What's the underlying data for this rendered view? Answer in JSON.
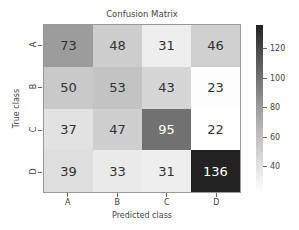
{
  "chart_data": {
    "type": "heatmap",
    "title": "Confusion Matrix",
    "xlabel": "Predicted class",
    "ylabel": "True class",
    "x_categories": [
      "A",
      "B",
      "C",
      "D"
    ],
    "y_categories": [
      "A",
      "B",
      "C",
      "D"
    ],
    "values": [
      [
        73,
        48,
        31,
        46
      ],
      [
        50,
        53,
        43,
        23
      ],
      [
        37,
        47,
        95,
        22
      ],
      [
        39,
        33,
        31,
        136
      ]
    ],
    "colormap": "Greys",
    "vmin": 22,
    "vmax": 136,
    "colorbar_ticks": [
      40,
      60,
      80,
      100,
      120
    ],
    "grid": false
  },
  "labels": {
    "title": "Confusion Matrix",
    "xlabel": "Predicted class",
    "ylabel": "True class"
  }
}
